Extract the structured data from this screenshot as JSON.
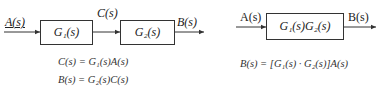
{
  "left_diagram": {
    "input_label": "A(s)",
    "block1_label": "G₁(s)",
    "intermediate_label": "C(s)",
    "block2_label": "G₂(s)",
    "output_label": "B(s)",
    "equations": [
      "C(s) = G₁(s)A(s)",
      "B(s) = G₂(s)C(s)"
    ]
  },
  "right_diagram": {
    "input_label": "A(s)",
    "block_label": "G₁(s)G₂(s)",
    "output_label": "B(s)",
    "equation": "B(s) = [G₁(s) · G₂(s)]A(s)"
  },
  "colors": {
    "line": "#333333",
    "text": "#222222",
    "background": "#ffffff"
  }
}
